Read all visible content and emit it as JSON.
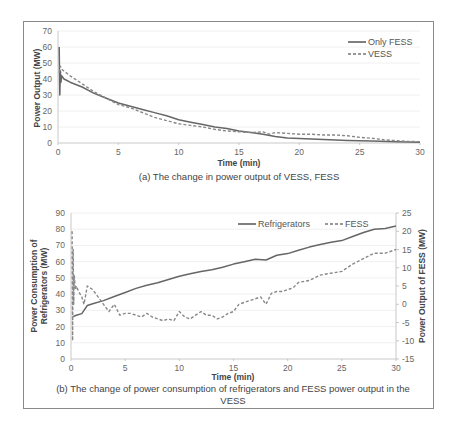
{
  "chart_data": [
    {
      "type": "line",
      "id": "a",
      "caption": "(a) The change in power output of VESS, FESS",
      "xlabel": "Time (min)",
      "ylabel": "Power Output (MW)",
      "xlim": [
        0,
        30
      ],
      "ylim": [
        0,
        70
      ],
      "xticks": [
        0,
        5,
        10,
        15,
        20,
        25,
        30
      ],
      "yticks": [
        0,
        10,
        20,
        30,
        40,
        50,
        60,
        70
      ],
      "grid": true,
      "legend_position": "top-right",
      "series": [
        {
          "name": "Only FESS",
          "style": "solid",
          "color": "#666666",
          "x": [
            0.1,
            0.15,
            0.2,
            0.25,
            0.3,
            0.5,
            1,
            2,
            3,
            4,
            5,
            6,
            7,
            8,
            9,
            10,
            11,
            12,
            13,
            14,
            15,
            16,
            17,
            18,
            19,
            20,
            22,
            24,
            26,
            28,
            30
          ],
          "y": [
            60,
            30,
            45,
            38,
            42,
            40,
            38,
            35,
            31,
            28,
            25,
            23,
            21,
            19,
            17,
            14.5,
            13,
            11.5,
            10,
            9,
            7.5,
            6.5,
            5.5,
            4,
            3.2,
            2.8,
            2.2,
            1.6,
            1.2,
            0.8,
            0.5
          ]
        },
        {
          "name": "VESS",
          "style": "dashed",
          "color": "#888888",
          "x": [
            0.1,
            0.2,
            0.3,
            0.5,
            1,
            2,
            3,
            4,
            5,
            6,
            7,
            8,
            9,
            10,
            11,
            12,
            13,
            14,
            15,
            16,
            17,
            17.5,
            18,
            19,
            20,
            21,
            22,
            23,
            24,
            25,
            26,
            27,
            28,
            29,
            30
          ],
          "y": [
            44,
            48,
            46,
            45,
            42,
            37,
            32,
            28,
            24,
            22,
            19,
            16,
            14,
            12,
            11,
            10,
            8.5,
            7.5,
            7,
            6.5,
            7,
            5.5,
            6.5,
            6,
            5.5,
            5.5,
            5,
            5,
            4.5,
            3.5,
            3,
            2,
            1.5,
            1,
            0.8
          ]
        }
      ]
    },
    {
      "type": "line",
      "id": "b",
      "caption_line1": "(b) The change of power consumption of refrigerators and FESS power output in the",
      "caption_line2": "VESS",
      "xlabel": "Time (min)",
      "ylabel_left_line1": "Power Consumption of",
      "ylabel_left_line2": "Refrigerators (MW)",
      "ylabel_right": "Power Output of FESS (MW)",
      "xlim": [
        0,
        30
      ],
      "ylim_left": [
        0,
        90
      ],
      "ylim_right": [
        -15,
        25
      ],
      "xticks": [
        0,
        5,
        10,
        15,
        20,
        25,
        30
      ],
      "yticks_left": [
        0,
        10,
        20,
        30,
        40,
        50,
        60,
        70,
        80,
        90
      ],
      "yticks_right": [
        -15,
        -10,
        -5,
        0,
        5,
        10,
        15,
        20,
        25
      ],
      "grid": true,
      "legend_position": "top-right-horizontal",
      "series": [
        {
          "name": "Refrigerators",
          "axis": "left",
          "style": "solid",
          "color": "#666666",
          "x": [
            0.2,
            0.3,
            0.5,
            1,
            1.2,
            1.5,
            2,
            3,
            4,
            5,
            6,
            7,
            8,
            9,
            10,
            11,
            12,
            13,
            14,
            15,
            16,
            17,
            18,
            19,
            20,
            21,
            22,
            23,
            24,
            25,
            26,
            27,
            28,
            29,
            30
          ],
          "y": [
            26,
            26.5,
            27,
            28,
            30,
            33,
            34,
            36,
            38.5,
            41,
            43.5,
            45.5,
            47,
            49,
            51,
            52.5,
            54,
            55,
            56.5,
            58.5,
            60,
            61.5,
            61,
            64,
            65,
            67,
            69,
            70.5,
            72,
            73,
            75.5,
            78,
            80,
            80.5,
            82
          ]
        },
        {
          "name": "FESS",
          "axis": "right",
          "style": "dashed",
          "color": "#888888",
          "x": [
            0.1,
            0.15,
            0.2,
            0.25,
            0.3,
            0.4,
            0.5,
            0.7,
            1,
            1.2,
            1.5,
            2,
            2.5,
            3,
            3.5,
            4,
            4.5,
            5,
            5.5,
            6,
            6.5,
            7,
            7.5,
            8,
            8.5,
            9,
            9.5,
            10,
            10.5,
            11,
            11.5,
            12,
            12.5,
            13,
            13.5,
            14,
            14.5,
            15,
            15.5,
            16,
            16.5,
            17,
            17.5,
            18,
            18.5,
            19,
            19.5,
            20,
            20.5,
            21,
            22,
            23,
            24,
            25,
            26,
            27,
            28,
            29,
            30
          ],
          "y": [
            20,
            -10,
            15,
            0,
            8,
            4,
            5,
            3.5,
            2,
            0,
            5,
            4,
            2,
            0,
            -2,
            0,
            -3,
            -2.5,
            -2.5,
            -3,
            -3.5,
            -2.5,
            -3.5,
            -4,
            -4.5,
            -4,
            -4.5,
            -2,
            -3.5,
            -4,
            -3,
            -2,
            -3,
            -3,
            -4,
            -3.5,
            -2.5,
            -2,
            0,
            0.5,
            1,
            1.5,
            2,
            0,
            3,
            3.5,
            3.5,
            4,
            4.5,
            6,
            6.5,
            8,
            8.5,
            9,
            11,
            12.5,
            14,
            14,
            15
          ]
        }
      ]
    }
  ]
}
